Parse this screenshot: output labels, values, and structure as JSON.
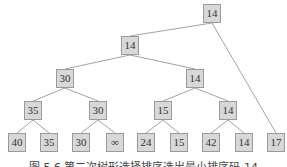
{
  "caption": "图 5.6   第二次树形选择排序选出最小排序码 14",
  "colors": {
    "node_fill": "#d8d8d8",
    "node_border": "#9a9a9a",
    "edge": "#8a8a8a",
    "text": "#333333"
  },
  "nodes": [
    {
      "id": "n0",
      "label": "14",
      "x": 203,
      "y": 4
    },
    {
      "id": "n1",
      "label": "14",
      "x": 121,
      "y": 36
    },
    {
      "id": "n2",
      "label": "30",
      "x": 56,
      "y": 69
    },
    {
      "id": "n3",
      "label": "14",
      "x": 186,
      "y": 69
    },
    {
      "id": "n4",
      "label": "35",
      "x": 24,
      "y": 101
    },
    {
      "id": "n5",
      "label": "30",
      "x": 89,
      "y": 101
    },
    {
      "id": "n6",
      "label": "15",
      "x": 154,
      "y": 101
    },
    {
      "id": "n7",
      "label": "14",
      "x": 219,
      "y": 101
    },
    {
      "id": "l0",
      "label": "40",
      "x": 8,
      "y": 133
    },
    {
      "id": "l1",
      "label": "35",
      "x": 40,
      "y": 133
    },
    {
      "id": "l2",
      "label": "30",
      "x": 72,
      "y": 133
    },
    {
      "id": "l3",
      "label": "∞",
      "x": 106,
      "y": 133
    },
    {
      "id": "l4",
      "label": "24",
      "x": 137,
      "y": 133
    },
    {
      "id": "l5",
      "label": "15",
      "x": 170,
      "y": 133
    },
    {
      "id": "l6",
      "label": "42",
      "x": 202,
      "y": 133
    },
    {
      "id": "l7",
      "label": "14",
      "x": 235,
      "y": 133
    },
    {
      "id": "l8",
      "label": "17",
      "x": 267,
      "y": 133
    }
  ],
  "edges": [
    [
      "n0",
      "n1"
    ],
    [
      "n0",
      "l8"
    ],
    [
      "n1",
      "n2"
    ],
    [
      "n1",
      "n3"
    ],
    [
      "n2",
      "n4"
    ],
    [
      "n2",
      "n5"
    ],
    [
      "n3",
      "n6"
    ],
    [
      "n3",
      "n7"
    ],
    [
      "n4",
      "l0"
    ],
    [
      "n4",
      "l1"
    ],
    [
      "n5",
      "l2"
    ],
    [
      "n5",
      "l3"
    ],
    [
      "n6",
      "l4"
    ],
    [
      "n6",
      "l5"
    ],
    [
      "n7",
      "l6"
    ],
    [
      "n7",
      "l7"
    ]
  ]
}
